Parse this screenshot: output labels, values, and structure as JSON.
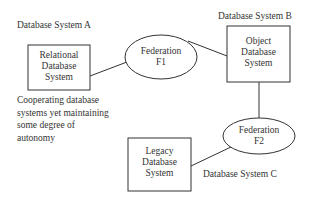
{
  "diagram": {
    "systems": [
      {
        "id": "A",
        "title": "Database System A",
        "box_lines": [
          "Relational",
          "Database",
          "System"
        ]
      },
      {
        "id": "B",
        "title": "Database System B",
        "box_lines": [
          "Object",
          "Database",
          "System"
        ]
      },
      {
        "id": "C",
        "title": "Database System C",
        "box_lines": [
          "Legacy",
          "Database",
          "System"
        ]
      }
    ],
    "federations": [
      {
        "id": "F1",
        "lines": [
          "Federation",
          "F1"
        ]
      },
      {
        "id": "F2",
        "lines": [
          "Federation",
          "F2"
        ]
      }
    ],
    "note_lines": [
      "Cooperating database",
      "systems yet maintaining",
      "some degree of",
      "autonomy"
    ],
    "edges": [
      [
        "A",
        "F1"
      ],
      [
        "F1",
        "B"
      ],
      [
        "B",
        "F2"
      ],
      [
        "F2",
        "C"
      ]
    ],
    "colors": {
      "stroke": "#333333",
      "text": "#333333",
      "background": "#ffffff"
    }
  }
}
